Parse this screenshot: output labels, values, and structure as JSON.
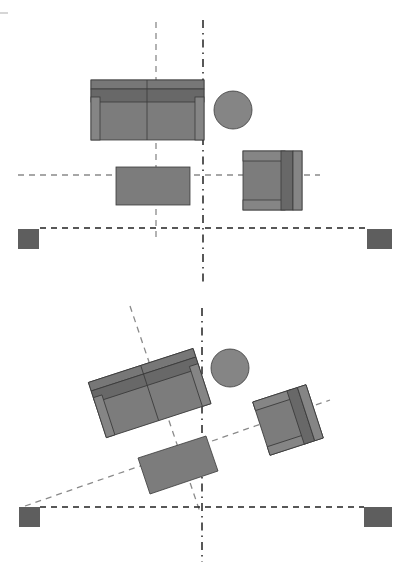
{
  "diagram": {
    "colors": {
      "background": "#ffffff",
      "furniture_fill": "#7c7c7c",
      "furniture_back": "#6a6a6a",
      "furniture_arm": "#858585",
      "speaker_fill": "#5e5e5e",
      "axis_gray": "#8a8a8a",
      "axis_black": "#222222"
    },
    "panels": [
      {
        "name": "top-layout-orthogonal",
        "sofa": {
          "x": 91,
          "y": 80,
          "w": 113,
          "h": 60,
          "rotation": 0
        },
        "side_table_round": {
          "cx": 233,
          "cy": 110,
          "r": 19
        },
        "coffee_table": {
          "x": 116,
          "y": 167,
          "w": 74,
          "h": 38,
          "rotation": 0
        },
        "armchair": {
          "x": 243,
          "y": 151,
          "w": 59,
          "h": 59,
          "rotation": 0
        },
        "speakers": [
          {
            "x": 18,
            "y": 229,
            "w": 21,
            "h": 20
          },
          {
            "x": 367,
            "y": 229,
            "w": 25,
            "h": 20
          }
        ],
        "axes": {
          "vertical_gray_x": 156,
          "vertical_dashdot_x": 203,
          "horizontal_gray_y": 175,
          "horizontal_black_y": 228
        }
      },
      {
        "name": "bottom-layout-angled",
        "rotation_deg": -18,
        "sofa_corners": [
          [
            89,
            383
          ],
          [
            193,
            349
          ],
          [
            211,
            403
          ],
          [
            107,
            439
          ]
        ],
        "side_table_round": {
          "cx": 230,
          "cy": 368,
          "r": 19
        },
        "coffee_table_corners": [
          [
            138,
            458
          ],
          [
            206,
            436
          ],
          [
            218,
            471
          ],
          [
            150,
            494
          ]
        ],
        "armchair_corners": [
          [
            252,
            401
          ],
          [
            305,
            383
          ],
          [
            323,
            438
          ],
          [
            270,
            456
          ]
        ],
        "speakers": [
          {
            "x": 19,
            "y": 507,
            "w": 21,
            "h": 20
          },
          {
            "x": 364,
            "y": 507,
            "w": 28,
            "h": 20
          }
        ],
        "axes": {
          "vertical_dashdot_x": 202,
          "horizontal_black_y": 507
        }
      }
    ]
  }
}
